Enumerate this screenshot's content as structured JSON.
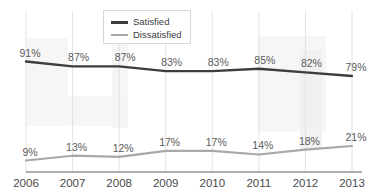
{
  "chart_data": {
    "type": "line",
    "title": "",
    "subtitle": "",
    "xlabel": "",
    "ylabel": "",
    "categories": [
      "2006",
      "2007",
      "2008",
      "2009",
      "2010",
      "2011",
      "2012",
      "2013"
    ],
    "ylim": [
      0,
      100
    ],
    "grid": "vertical",
    "legend_position": "top-center",
    "series": [
      {
        "name": "Satisfied",
        "color": "#3d3d3d",
        "values": [
          91,
          87,
          87,
          83,
          83,
          85,
          82,
          79
        ],
        "labels": [
          "91%",
          "87%",
          "87%",
          "83%",
          "83%",
          "85%",
          "82%",
          "79%"
        ]
      },
      {
        "name": "Dissatisfied",
        "color": "#a8a8a8",
        "values": [
          9,
          13,
          12,
          17,
          17,
          14,
          18,
          21
        ],
        "labels": [
          "9%",
          "13%",
          "12%",
          "17%",
          "17%",
          "14%",
          "18%",
          "21%"
        ]
      }
    ]
  },
  "legend": {
    "entries": [
      {
        "label": "Satisfied"
      },
      {
        "label": "Dissatisfied"
      }
    ]
  },
  "axis": {
    "tick_labels": [
      "2006",
      "2007",
      "2008",
      "2009",
      "2010",
      "2011",
      "2012",
      "2013"
    ]
  },
  "colors": {
    "satisfied_line": "#3d3d3d",
    "dissatisfied_line": "#a8a8a8",
    "gridline": "#e2e2e2",
    "axis_line": "#5e5e5e",
    "label_text": "#5a5a5a",
    "background": "#ffffff"
  }
}
